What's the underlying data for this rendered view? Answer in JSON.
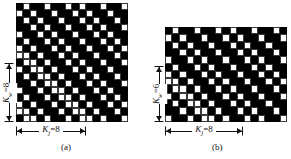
{
  "figure": {
    "kind": "weave-draft-diagram",
    "background_color": "#ffffff",
    "raised_color": "#000000",
    "lowered_color": "#ffffff"
  },
  "panels": [
    {
      "id": "a",
      "caption": "(a)",
      "columns": 16,
      "rows": 17,
      "cell_px": 7,
      "warp_repeat_label": {
        "symbol": "K",
        "subscript": "j",
        "equals": "=",
        "value": "8",
        "text": "Kj = 8"
      },
      "weft_repeat_label": {
        "symbol": "K",
        "subscript": "w",
        "equals": "=",
        "value": "8",
        "text": "Kw = 8"
      },
      "grid": [
        "1011011010110110",
        "0101101101011011",
        "1010110110101101",
        "1101011011010110",
        "0110101101101011",
        "1011010110110101",
        "0101101011011010",
        "0010110101101101",
        "1001011010110110",
        "0100101101011011",
        "1010010110101101",
        "1101001011010110",
        "0110100101101011",
        "1011010010110101",
        "0101101001011010",
        "0010110100101101",
        "1001011010010110"
      ]
    },
    {
      "id": "b",
      "caption": "(b)",
      "columns": 17,
      "rows": 13,
      "cell_px": 7,
      "warp_repeat_label": {
        "symbol": "K",
        "subscript": "j",
        "equals": "=",
        "value": "8",
        "text": "Kj = 8"
      },
      "weft_repeat_label": {
        "symbol": "K",
        "subscript": "w",
        "equals": "=",
        "value": "6",
        "text": "Kw = 6"
      },
      "grid": [
        "10110110101101101",
        "01011011010110110",
        "10101101101011011",
        "11010110110101101",
        "01101011011010110",
        "10110101101101011",
        "01011010110110101",
        "00101101011011010",
        "10010110101101101",
        "01001011010110110",
        "10100101101011011",
        "11010010110101101",
        "01101001011010110"
      ]
    }
  ]
}
